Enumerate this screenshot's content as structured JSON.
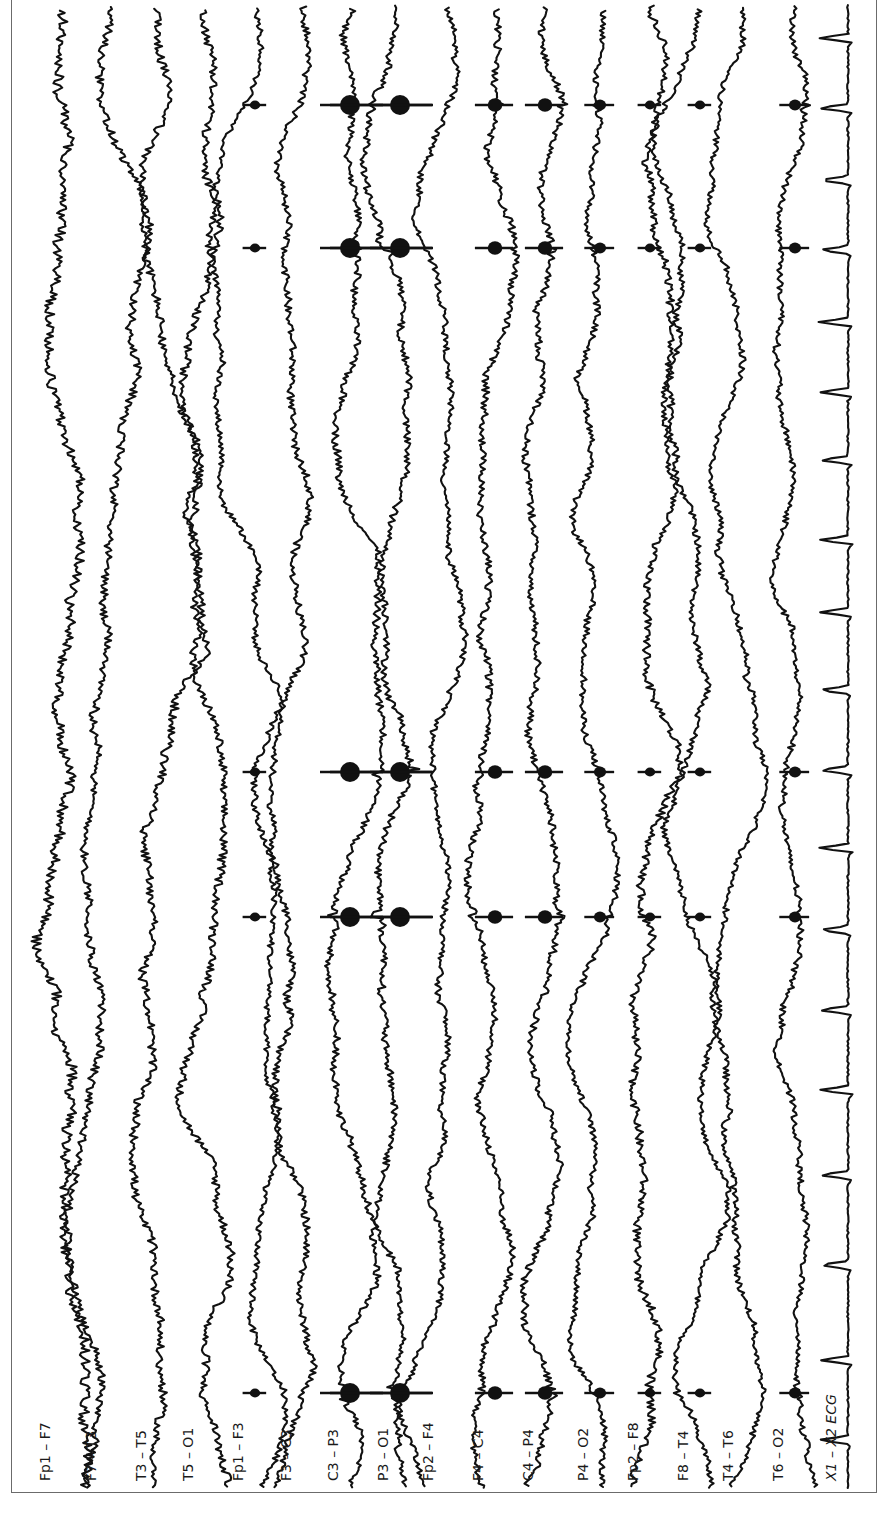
{
  "figure": {
    "title": "",
    "orientation": "rotated-90-ccw",
    "frame_color": "#6b6b6b",
    "trace_color": "#111111",
    "background": "#ffffff"
  },
  "chart_data": {
    "type": "line",
    "title": "",
    "subtitle": "",
    "xlabel": "",
    "ylabel": "",
    "grid": false,
    "legend": "none",
    "channels": [
      {
        "label": "Fp1 – F7",
        "x": 62,
        "amp": 10,
        "wander": 14,
        "spikes": 0
      },
      {
        "label": "F7 – T3",
        "x": 108,
        "amp": 8,
        "wander": 12,
        "spikes": 0
      },
      {
        "label": "T3 – T5",
        "x": 158,
        "amp": 8,
        "wander": 10,
        "spikes": 0
      },
      {
        "label": "T5 – O1",
        "x": 205,
        "amp": 8,
        "wander": 12,
        "spikes": 0
      },
      {
        "label": "Fp1 – F3",
        "x": 255,
        "amp": 6,
        "wander": 6,
        "spikes": 0.2
      },
      {
        "label": "F3 – C3",
        "x": 303,
        "amp": 7,
        "wander": 8,
        "spikes": 0
      },
      {
        "label": "C3 – P3",
        "x": 350,
        "amp": 7,
        "wander": 10,
        "spikes": 1.0
      },
      {
        "label": "P3 – O1",
        "x": 400,
        "amp": 7,
        "wander": 10,
        "spikes": 1.0
      },
      {
        "label": "Fp2 – F4",
        "x": 445,
        "amp": 6,
        "wander": 9,
        "spikes": 0
      },
      {
        "label": "F4 – C4",
        "x": 495,
        "amp": 7,
        "wander": 9,
        "spikes": 0.55
      },
      {
        "label": "C4 – P4",
        "x": 545,
        "amp": 7,
        "wander": 10,
        "spikes": 0.55
      },
      {
        "label": "P4 – O2",
        "x": 600,
        "amp": 6,
        "wander": 6,
        "spikes": 0.35
      },
      {
        "label": "Fp2 – F8",
        "x": 650,
        "amp": 8,
        "wander": 16,
        "spikes": 0.2
      },
      {
        "label": "F8 – T4",
        "x": 700,
        "amp": 6,
        "wander": 8,
        "spikes": 0.2
      },
      {
        "label": "T4 – T6",
        "x": 745,
        "amp": 6,
        "wander": 10,
        "spikes": 0
      },
      {
        "label": "T6 – O2",
        "x": 795,
        "amp": 6,
        "wander": 7,
        "spikes": 0.35
      },
      {
        "label": "X1 – X2 ECG",
        "x": 848,
        "amp": 1,
        "wander": 2,
        "spikes": 0,
        "ecg": true
      }
    ],
    "spike_burst_positions_y": [
      105,
      248,
      772,
      917,
      1393
    ],
    "ecg_qrs_positions_y": [
      38,
      108,
      180,
      250,
      322,
      392,
      460,
      540,
      612,
      690,
      770,
      848,
      930,
      1010,
      1090,
      1175,
      1265,
      1360,
      1440
    ],
    "y_range_px": [
      5,
      1485
    ],
    "labels_y_px": 1465
  }
}
